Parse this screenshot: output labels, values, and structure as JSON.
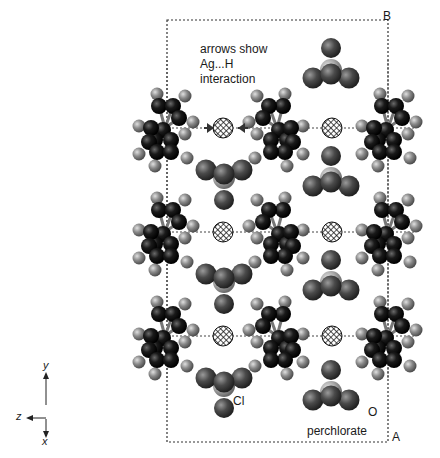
{
  "figure": {
    "annotation_lines": [
      "arrows show",
      "Ag...H",
      "interaction"
    ],
    "corner_labels": {
      "B": "B",
      "A": "A"
    },
    "atom_labels": {
      "cl": "Cl",
      "o": "O",
      "perchlorate": "perchlorate"
    },
    "axes": {
      "y": "y",
      "z": "z",
      "x": "x"
    }
  },
  "colors": {
    "carbon": "#111111",
    "hydrogen": "#8a8a8a",
    "oxygen": "#4a4a4a",
    "chlorine": "#a8a8a8",
    "box": "#333333"
  },
  "cell_box": {
    "x": 167,
    "y": 20,
    "w": 221,
    "h": 422
  },
  "layer_lines_y": [
    128,
    232,
    336
  ],
  "silver_atoms": [
    {
      "x": 223,
      "y": 128
    },
    {
      "x": 332,
      "y": 128
    },
    {
      "x": 223,
      "y": 232
    },
    {
      "x": 332,
      "y": 232
    },
    {
      "x": 223,
      "y": 336
    },
    {
      "x": 332,
      "y": 336
    }
  ],
  "perchlorates": [
    {
      "x": 331,
      "y": 70,
      "dir": "up"
    },
    {
      "x": 224,
      "y": 178,
      "dir": "down"
    },
    {
      "x": 331,
      "y": 178,
      "dir": "up"
    },
    {
      "x": 224,
      "y": 282,
      "dir": "down"
    },
    {
      "x": 331,
      "y": 282,
      "dir": "up"
    },
    {
      "x": 224,
      "y": 386,
      "dir": "down"
    },
    {
      "x": 331,
      "y": 392,
      "dir": "up"
    }
  ],
  "rings": [
    {
      "x": 165,
      "y": 128,
      "flip": false
    },
    {
      "x": 277,
      "y": 128,
      "flip": true
    },
    {
      "x": 388,
      "y": 128,
      "flip": false
    },
    {
      "x": 165,
      "y": 232,
      "flip": false
    },
    {
      "x": 277,
      "y": 232,
      "flip": true
    },
    {
      "x": 388,
      "y": 232,
      "flip": false
    },
    {
      "x": 165,
      "y": 336,
      "flip": false
    },
    {
      "x": 277,
      "y": 336,
      "flip": true
    },
    {
      "x": 388,
      "y": 336,
      "flip": false
    }
  ],
  "arrows": [
    {
      "x1": 204,
      "y1": 128,
      "x2": 214,
      "y2": 128
    },
    {
      "x1": 248,
      "y1": 128,
      "x2": 238,
      "y2": 128
    }
  ]
}
